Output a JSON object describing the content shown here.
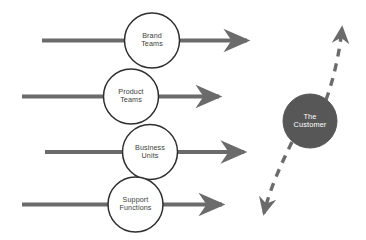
{
  "diagram": {
    "colors": {
      "arrow_gray": "#6b6b6b",
      "circle_stroke": "#2f2f2f",
      "circle_fill": "#ffffff",
      "customer_fill": "#575757",
      "customer_text": "#ffffff",
      "node_text": "#3d3d3d",
      "background": "#ffffff"
    },
    "flows": [
      {
        "id": "brand-teams",
        "label_lines": [
          "Brand",
          "Teams"
        ],
        "circle": {
          "cx": 152,
          "cy": 40.5,
          "r": 27.5
        },
        "line": {
          "x1": 42,
          "y1": 40.5,
          "x2": 253,
          "y2": 40.5
        }
      },
      {
        "id": "product-teams",
        "label_lines": [
          "Product",
          "Teams"
        ],
        "circle": {
          "cx": 131,
          "cy": 96.5,
          "r": 27.5
        },
        "line": {
          "x1": 22,
          "y1": 96.5,
          "x2": 225,
          "y2": 96.5
        }
      },
      {
        "id": "business-units",
        "label_lines": [
          "Business",
          "Units"
        ],
        "circle": {
          "cx": 150,
          "cy": 152,
          "r": 27.5
        },
        "line": {
          "x1": 45,
          "y1": 152,
          "x2": 250,
          "y2": 152
        }
      },
      {
        "id": "support-functions",
        "label_lines": [
          "Support",
          "Functions"
        ],
        "circle": {
          "cx": 135.5,
          "cy": 204.5,
          "r": 27.5
        },
        "line": {
          "x1": 22,
          "y1": 204.5,
          "x2": 228,
          "y2": 204.5
        }
      }
    ],
    "customer": {
      "id": "the-customer",
      "label_lines": [
        "The",
        "Customer"
      ],
      "circle": {
        "cx": 310,
        "cy": 121,
        "r": 27
      }
    },
    "dashed_paths": [
      {
        "id": "customer-up-arrow",
        "direction": "up",
        "from": {
          "x": 326,
          "y": 99
        },
        "to": {
          "x": 343,
          "y": 22
        }
      },
      {
        "id": "customer-down-arrow",
        "direction": "down",
        "from": {
          "x": 292,
          "y": 142
        },
        "to": {
          "x": 263,
          "y": 220
        }
      }
    ]
  }
}
